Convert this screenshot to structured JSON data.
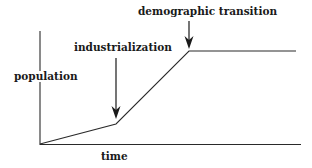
{
  "diagram": {
    "type": "line-schematic",
    "axes": {
      "x_label": "time",
      "y_label": "population"
    },
    "curve_points": [
      {
        "x": 40,
        "y": 144
      },
      {
        "x": 116,
        "y": 124
      },
      {
        "x": 189,
        "y": 51
      },
      {
        "x": 296,
        "y": 51
      }
    ],
    "annotations": [
      {
        "id": "industrialization",
        "label": "industrialization",
        "arrow_x": 116,
        "arrow_top": 58,
        "arrow_bottom": 118
      },
      {
        "id": "demographic_transition",
        "label": "demographic transition",
        "arrow_x": 189,
        "arrow_top": 21,
        "arrow_bottom": 48
      }
    ],
    "colors": {
      "line": "#2a2a2a",
      "text": "#1a1a1a",
      "background": "#ffffff"
    }
  }
}
